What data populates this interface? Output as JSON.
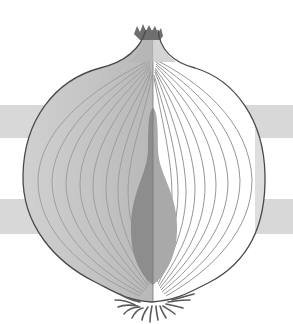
{
  "illustration": {
    "subject": "onion cross-section",
    "colors": {
      "background": "#ffffff",
      "band": "#d8d8d8",
      "outline": "#555555",
      "left_half": "#c9c9c9",
      "right_half": "#ffffff",
      "layer_lines": "#8a8a8a",
      "bud_left": "#8d8d8d",
      "bud_right": "#a9a9a9",
      "roots": "#5a5a5a"
    }
  }
}
